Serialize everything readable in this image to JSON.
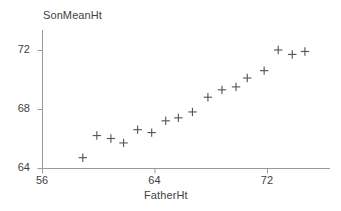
{
  "chart_data": {
    "type": "scatter",
    "title": "",
    "xlabel": "FatherHt",
    "ylabel": "SonMeanHt",
    "xlim": [
      56,
      76
    ],
    "ylim": [
      64,
      73.5
    ],
    "xticks": [
      56,
      64,
      72
    ],
    "yticks": [
      64,
      68,
      72
    ],
    "grid": false,
    "legend": null,
    "marker": "plus",
    "marker_color": "#58585c",
    "axis_color": "#9a9a9a",
    "series": [
      {
        "name": "SonMeanHt vs FatherHt",
        "x": [
          58.9,
          59.9,
          60.9,
          61.8,
          62.8,
          63.8,
          64.8,
          65.7,
          66.7,
          67.8,
          68.8,
          69.8,
          70.6,
          71.8,
          72.8,
          73.8,
          74.7
        ],
        "y": [
          64.7,
          66.2,
          66.0,
          65.7,
          66.6,
          66.4,
          67.2,
          67.4,
          67.8,
          68.8,
          69.3,
          69.5,
          70.1,
          70.6,
          72.0,
          71.7,
          71.9
        ]
      }
    ],
    "points": [
      {
        "x": 58.9,
        "y": 64.7
      },
      {
        "x": 59.9,
        "y": 66.2
      },
      {
        "x": 60.9,
        "y": 66.0
      },
      {
        "x": 61.8,
        "y": 65.7
      },
      {
        "x": 62.8,
        "y": 66.6
      },
      {
        "x": 63.8,
        "y": 66.4
      },
      {
        "x": 64.8,
        "y": 67.2
      },
      {
        "x": 65.7,
        "y": 67.4
      },
      {
        "x": 66.7,
        "y": 67.8
      },
      {
        "x": 67.8,
        "y": 68.8
      },
      {
        "x": 68.8,
        "y": 69.3
      },
      {
        "x": 69.8,
        "y": 69.5
      },
      {
        "x": 70.6,
        "y": 70.1
      },
      {
        "x": 71.8,
        "y": 70.6
      },
      {
        "x": 72.8,
        "y": 72.0
      },
      {
        "x": 73.8,
        "y": 71.7
      },
      {
        "x": 74.7,
        "y": 71.9
      }
    ]
  },
  "axes": {
    "y_title": "SonMeanHt",
    "x_title": "FatherHt",
    "y_tick_labels": [
      "72",
      "68",
      "64"
    ],
    "x_tick_labels": [
      "56",
      "64",
      "72"
    ]
  }
}
